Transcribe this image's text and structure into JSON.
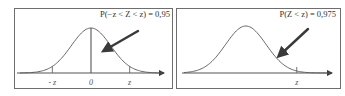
{
  "chart_data": [
    {
      "type": "line",
      "title": "",
      "distribution": "standard-normal",
      "annotation": "P(−z < Z < z) = 0,95",
      "probability": 0.95,
      "shaded_region": "between -z and z",
      "x_tick_labels": [
        "- z",
        "0",
        "z"
      ],
      "x_tick_values": [
        -1.96,
        0,
        1.96
      ],
      "xlim": [
        -3.6,
        3.6
      ],
      "center_line": true,
      "grid": false,
      "legend": "none"
    },
    {
      "type": "line",
      "title": "",
      "distribution": "standard-normal",
      "annotation": "P(Z < z) = 0,975",
      "probability": 0.975,
      "shaded_region": "left of z",
      "x_tick_labels": [
        "z"
      ],
      "x_tick_values": [
        1.96
      ],
      "xlim": [
        -3.6,
        3.6
      ],
      "center_line": false,
      "grid": false,
      "legend": "none"
    }
  ]
}
